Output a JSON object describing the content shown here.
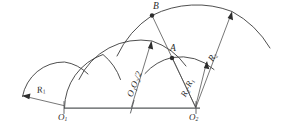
{
  "figure": {
    "background_color": "#ffffff",
    "line_color": "#3b3b3b",
    "baseline_color": "#55585a",
    "width": 283,
    "height": 138
  },
  "points": {
    "o1": {
      "label": "O",
      "sub": "1"
    },
    "o2": {
      "label": "O",
      "sub": "2"
    },
    "a": {
      "label": "A"
    },
    "b": {
      "label": "B"
    }
  },
  "dimensions": {
    "r1": {
      "text": "R",
      "sub": "1"
    },
    "r2": {
      "text": "R",
      "sub": "2"
    },
    "half_o1o2": {
      "text": "O₁O₂/2"
    },
    "r2_minus_r1": {
      "text": "R₂-R₁"
    }
  },
  "elements": {
    "baseline_name": "baseline-o1-o2",
    "arc_small_o1": "arc-radius-r1-about-o1",
    "arc_large_o1": "arc-large-about-o1",
    "arc_mid": "arc-half-o1o2",
    "arc_small_o2": "arc-small-about-o2",
    "arc_large_o2": "arc-radius-r2-about-o2"
  }
}
